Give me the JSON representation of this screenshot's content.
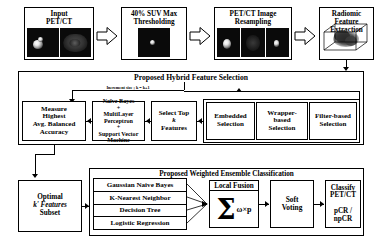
{
  "diagram": {
    "pipeline": [
      {
        "id": "input",
        "label": "Input\nPET/CT",
        "line1": "Input",
        "line2": "PET/CT"
      },
      {
        "id": "thresholding",
        "label": "40% SUV Max Thresholding",
        "line1": "40% SUV Max",
        "line2": "Thresholding"
      },
      {
        "id": "resampling",
        "label": "PET/CT Image Resampling",
        "line1": "PET/CT Image",
        "line2": "Resampling"
      },
      {
        "id": "extraction",
        "label": "Radiomic Feature Extraction",
        "line1": "Radiomic Feature",
        "line2": "Extraction"
      }
    ],
    "feature_selection": {
      "title": "Proposed Hybrid Feature Selection",
      "loop_label": "Increment size ; k = k+1",
      "boxes": [
        {
          "id": "measure",
          "lines": [
            "Measure",
            "Highest",
            "Avg. Balanced",
            "Accuracy"
          ]
        },
        {
          "id": "models",
          "lines": [
            "Naïve Bayes",
            "+",
            "MultiLayer",
            "Perceptron",
            "+",
            "Support Vector",
            "Machine"
          ]
        },
        {
          "id": "select-top",
          "lines": [
            "Select Top",
            "k",
            "Features"
          ]
        },
        {
          "id": "embedded",
          "lines": [
            "Embedded",
            "Selection"
          ]
        },
        {
          "id": "wrapper",
          "lines": [
            "Wrapper-",
            "based",
            "Selection"
          ]
        },
        {
          "id": "filter",
          "lines": [
            "Filter-based",
            "Selection"
          ]
        }
      ]
    },
    "optimal_subset": {
      "lines": [
        "Optimal",
        "k' Features",
        "Subset"
      ]
    },
    "ensemble": {
      "title": "Proposed Weighted Ensemble Classification",
      "classifiers": [
        "Gaussian Naive Bayes",
        "K-Nearest Neighbor",
        "Decision Tree",
        "Logistic Regression"
      ],
      "fusion": {
        "caption": "Local Fusion",
        "formula_sigma": "Σ",
        "formula_terms": "ω×p"
      },
      "voting": {
        "lines": [
          "Soft",
          "Voting"
        ]
      },
      "classify": {
        "line1": "Classify",
        "line2": "PET/CT",
        "line3": "pCR / npCR"
      }
    },
    "colors": {
      "stroke": "#000000",
      "background": "#ffffff",
      "thumb": "#0a0a0a"
    }
  }
}
